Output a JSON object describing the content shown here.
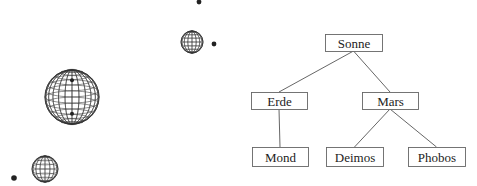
{
  "figure": {
    "planets": [
      {
        "name": "earth-sphere",
        "cx": 72,
        "cy": 97,
        "r": 27
      },
      {
        "name": "mars-sphere",
        "cx": 192,
        "cy": 42,
        "r": 11
      },
      {
        "name": "small-sphere",
        "cx": 45,
        "cy": 169,
        "r": 13
      }
    ],
    "moons": [
      {
        "name": "moon-dot-top",
        "cx": 199,
        "cy": 2,
        "r": 2.4
      },
      {
        "name": "moon-dot-mars",
        "cx": 214,
        "cy": 44,
        "r": 2.4
      },
      {
        "name": "moon-dot-bottom",
        "cx": 14,
        "cy": 178,
        "r": 2.8
      }
    ]
  },
  "tree": {
    "nodes": [
      {
        "id": "sonne",
        "label": "Sonne",
        "x": 325,
        "y": 34,
        "w": 57,
        "h": 17
      },
      {
        "id": "erde",
        "label": "Erde",
        "x": 251,
        "y": 92,
        "w": 56,
        "h": 17
      },
      {
        "id": "mars",
        "label": "Mars",
        "x": 362,
        "y": 92,
        "w": 56,
        "h": 17
      },
      {
        "id": "mond",
        "label": "Mond",
        "x": 252,
        "y": 147,
        "w": 56,
        "h": 19
      },
      {
        "id": "deimos",
        "label": "Deimos",
        "x": 326,
        "y": 147,
        "w": 57,
        "h": 19
      },
      {
        "id": "phobos",
        "label": "Phobos",
        "x": 408,
        "y": 147,
        "w": 57,
        "h": 19
      }
    ],
    "edges": [
      {
        "from": "sonne",
        "to": "erde"
      },
      {
        "from": "sonne",
        "to": "mars"
      },
      {
        "from": "erde",
        "to": "mond"
      },
      {
        "from": "mars",
        "to": "deimos"
      },
      {
        "from": "mars",
        "to": "phobos"
      }
    ]
  },
  "colors": {
    "line": "#555555",
    "box": "#666666",
    "mesh": "#333333",
    "dot": "#222222"
  }
}
